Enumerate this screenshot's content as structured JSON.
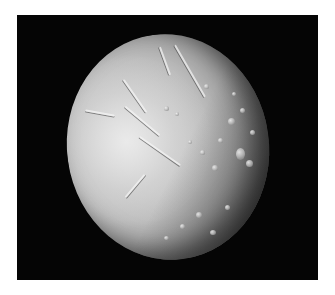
{
  "image": {
    "subject": "icy moon",
    "background_color": "#050505",
    "page_color": "#ffffff",
    "surface_colors": {
      "highlight": "#e8e8e8",
      "mid": "#bcbcbc",
      "shadow": "#4a4a4a"
    }
  }
}
